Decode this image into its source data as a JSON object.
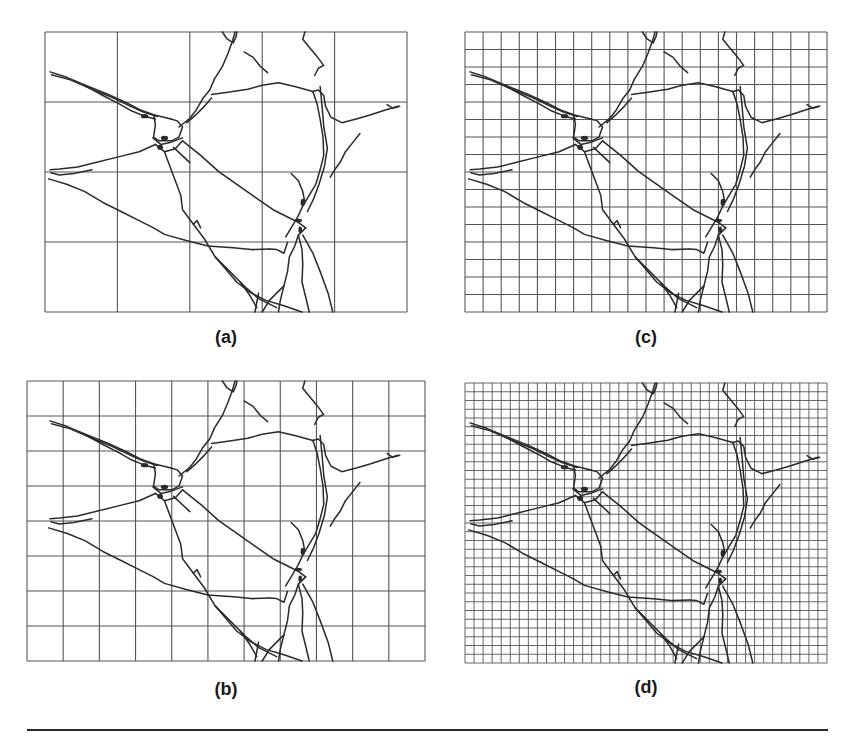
{
  "figure": {
    "panels": [
      {
        "id": "a",
        "label": "(a)",
        "cols": 5,
        "rows": 4,
        "x": 45,
        "y": 32,
        "w": 362,
        "h": 280,
        "label_x": 226,
        "label_y": 327
      },
      {
        "id": "b",
        "label": "(b)",
        "cols": 11,
        "rows": 8,
        "x": 27,
        "y": 381,
        "w": 398,
        "h": 280,
        "label_x": 226,
        "label_y": 679
      },
      {
        "id": "c",
        "label": "(c)",
        "cols": 20,
        "rows": 16,
        "x": 465,
        "y": 32,
        "w": 362,
        "h": 280,
        "label_x": 646,
        "label_y": 327
      },
      {
        "id": "d",
        "label": "(d)",
        "cols": 40,
        "rows": 32,
        "x": 465,
        "y": 383,
        "w": 362,
        "h": 280,
        "label_x": 646,
        "label_y": 677
      }
    ],
    "colors": {
      "grid": "#555555",
      "fracture": "#2b2b2b",
      "rule": "#2a2a2a"
    }
  }
}
